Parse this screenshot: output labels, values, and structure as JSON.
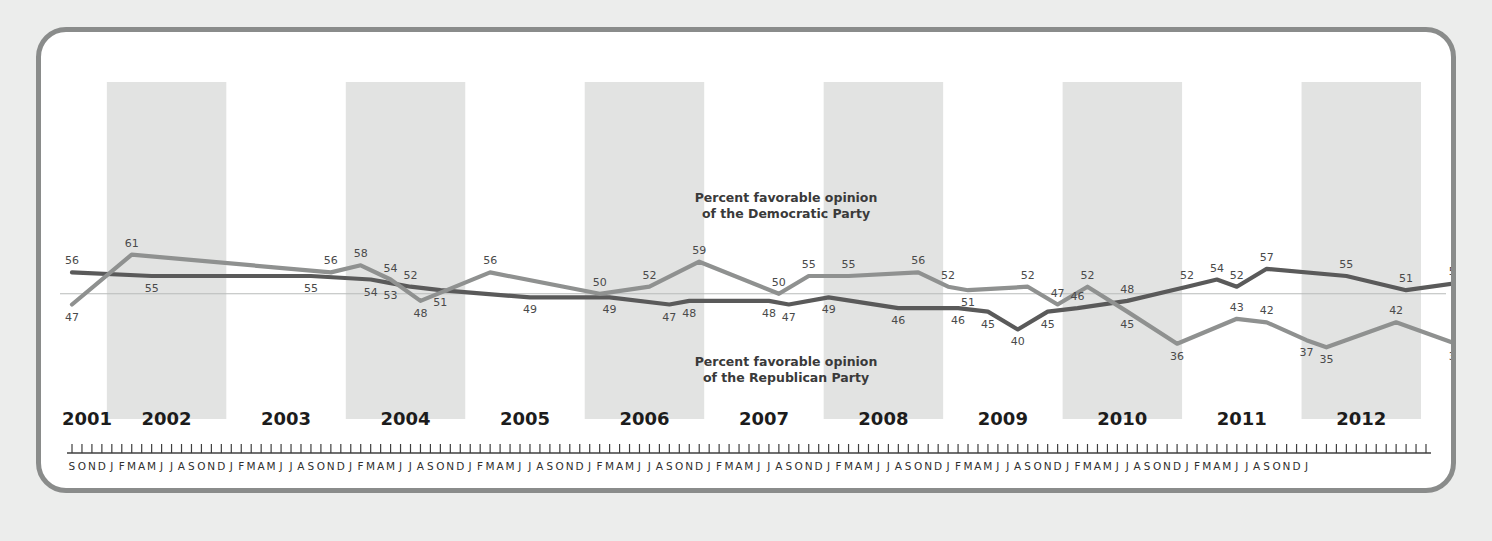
{
  "chart_data": {
    "type": "line",
    "title": "",
    "xlabel": "",
    "ylabel": "",
    "ylim": [
      30,
      63
    ],
    "grid": false,
    "legend_position": "inline-annotation",
    "annotations": [
      {
        "id": "dem",
        "text_line1": "Percent favorable opinion",
        "text_line2": "of the Democratic Party"
      },
      {
        "id": "rep",
        "text_line1": "Percent favorable opinion",
        "text_line2": "of the Republican Party"
      }
    ],
    "year_bands": [
      "2002",
      "2004",
      "2006",
      "2008",
      "2010",
      "2012"
    ],
    "years": [
      "2001",
      "2002",
      "2003",
      "2004",
      "2005",
      "2006",
      "2007",
      "2008",
      "2009",
      "2010",
      "2011",
      "2012"
    ],
    "month_ticks": "S O N D J F M A M J J A S O N D J F M A M J J A S O N D J F M A M J J A S O N D J F M A M J J A S O N D J F M A M J J A S O N D J F M A M J J A S O N D J F M A M J J A S O N D J F M A M J J A S O N D J F M A M J J A S O N D J F M A M J J A S O N D J",
    "series": [
      {
        "name": "Percent favorable opinion of the Democratic Party",
        "color": "#5a5a5a",
        "points": [
          {
            "t": 0,
            "label": "56",
            "value": 56,
            "lpos": "above"
          },
          {
            "t": 8,
            "label": "55",
            "value": 55,
            "lpos": "below"
          },
          {
            "t": 24,
            "label": "55",
            "value": 55,
            "lpos": "below"
          },
          {
            "t": 30,
            "label": "54",
            "value": 54,
            "lpos": "below"
          },
          {
            "t": 32,
            "label": "53",
            "value": 53,
            "lpos": "below"
          },
          {
            "t": 34,
            "label": "52",
            "value": 52,
            "lpos": "above"
          },
          {
            "t": 37,
            "label": "51",
            "value": 51,
            "lpos": "below"
          },
          {
            "t": 46,
            "label": "49",
            "value": 49,
            "lpos": "below"
          },
          {
            "t": 54,
            "label": "49",
            "value": 49,
            "lpos": "below"
          },
          {
            "t": 60,
            "label": "47",
            "value": 47,
            "lpos": "below"
          },
          {
            "t": 62,
            "label": "48",
            "value": 48,
            "lpos": "below"
          },
          {
            "t": 70,
            "label": "48",
            "value": 48,
            "lpos": "below"
          },
          {
            "t": 72,
            "label": "47",
            "value": 47,
            "lpos": "below"
          },
          {
            "t": 76,
            "label": "49",
            "value": 49,
            "lpos": "below"
          },
          {
            "t": 83,
            "label": "46",
            "value": 46,
            "lpos": "below"
          },
          {
            "t": 89,
            "label": "46",
            "value": 46,
            "lpos": "below"
          },
          {
            "t": 92,
            "label": "45",
            "value": 45,
            "lpos": "below"
          },
          {
            "t": 95,
            "label": "40",
            "value": 40,
            "lpos": "below"
          },
          {
            "t": 98,
            "label": "45",
            "value": 45,
            "lpos": "below"
          },
          {
            "t": 101,
            "label": "46",
            "value": 46,
            "lpos": "above"
          },
          {
            "t": 106,
            "label": "48",
            "value": 48,
            "lpos": "above"
          },
          {
            "t": 112,
            "label": "52",
            "value": 52,
            "lpos": "above"
          },
          {
            "t": 115,
            "label": "54",
            "value": 54,
            "lpos": "above"
          },
          {
            "t": 117,
            "label": "52",
            "value": 52,
            "lpos": "above"
          },
          {
            "t": 120,
            "label": "57",
            "value": 57,
            "lpos": "above"
          },
          {
            "t": 128,
            "label": "55",
            "value": 55,
            "lpos": "above"
          },
          {
            "t": 134,
            "label": "51",
            "value": 51,
            "lpos": "above"
          },
          {
            "t": 139,
            "label": "53",
            "value": 53,
            "lpos": "above"
          },
          {
            "t": 148,
            "label": "56",
            "value": 56,
            "lpos": "above"
          },
          {
            "t": 155,
            "label": "55",
            "value": 55,
            "lpos": "above"
          },
          {
            "t": 168,
            "label": "53",
            "value": 53,
            "lpos": "above"
          },
          {
            "t": 174,
            "label": "51",
            "value": 51,
            "lpos": "above"
          },
          {
            "t": 184,
            "label": "42",
            "value": 42,
            "lpos": "above"
          },
          {
            "t": 188,
            "label": "43",
            "value": 43,
            "lpos": "above"
          },
          {
            "t": 195,
            "label": "44",
            "value": 44,
            "lpos": "above"
          },
          {
            "t": 199,
            "label": "45",
            "value": 45,
            "lpos": "above"
          },
          {
            "t": 203,
            "label": "47",
            "value": 47,
            "lpos": "above"
          },
          {
            "t": 210,
            "label": "44",
            "value": 44,
            "lpos": "above"
          },
          {
            "t": 219,
            "label": "43",
            "value": 43,
            "lpos": "above"
          },
          {
            "t": 226,
            "label": "49",
            "value": 49,
            "lpos": "above"
          }
        ]
      },
      {
        "name": "Percent favorable opinion of the Republican Party",
        "color": "#8f9190",
        "points": [
          {
            "t": 0,
            "label": "47",
            "value": 47,
            "lpos": "below"
          },
          {
            "t": 6,
            "label": "61",
            "value": 61,
            "lpos": "above"
          },
          {
            "t": 26,
            "label": "56",
            "value": 56,
            "lpos": "above"
          },
          {
            "t": 29,
            "label": "58",
            "value": 58,
            "lpos": "above"
          },
          {
            "t": 32,
            "label": "54",
            "value": 54,
            "lpos": "above"
          },
          {
            "t": 35,
            "label": "48",
            "value": 48,
            "lpos": "below"
          },
          {
            "t": 42,
            "label": "56",
            "value": 56,
            "lpos": "above"
          },
          {
            "t": 53,
            "label": "50",
            "value": 50,
            "lpos": "above"
          },
          {
            "t": 58,
            "label": "52",
            "value": 52,
            "lpos": "above"
          },
          {
            "t": 63,
            "label": "59",
            "value": 59,
            "lpos": "above"
          },
          {
            "t": 71,
            "label": "50",
            "value": 50,
            "lpos": "above"
          },
          {
            "t": 74,
            "label": "55",
            "value": 55,
            "lpos": "above"
          },
          {
            "t": 78,
            "label": "55",
            "value": 55,
            "lpos": "above"
          },
          {
            "t": 85,
            "label": "56",
            "value": 56,
            "lpos": "above"
          },
          {
            "t": 88,
            "label": "52",
            "value": 52,
            "lpos": "above"
          },
          {
            "t": 90,
            "label": "51",
            "value": 51,
            "lpos": "below"
          },
          {
            "t": 96,
            "label": "52",
            "value": 52,
            "lpos": "above"
          },
          {
            "t": 99,
            "label": "47",
            "value": 47,
            "lpos": "above"
          },
          {
            "t": 102,
            "label": "52",
            "value": 52,
            "lpos": "above"
          },
          {
            "t": 106,
            "label": "45",
            "value": 45,
            "lpos": "below"
          },
          {
            "t": 111,
            "label": "36",
            "value": 36,
            "lpos": "below"
          },
          {
            "t": 117,
            "label": "43",
            "value": 43,
            "lpos": "above"
          },
          {
            "t": 120,
            "label": "42",
            "value": 42,
            "lpos": "above"
          },
          {
            "t": 124,
            "label": "37",
            "value": 37,
            "lpos": "below"
          },
          {
            "t": 126,
            "label": "35",
            "value": 35,
            "lpos": "below"
          },
          {
            "t": 133,
            "label": "42",
            "value": 42,
            "lpos": "above"
          },
          {
            "t": 139,
            "label": "36",
            "value": 36,
            "lpos": "below"
          },
          {
            "t": 143,
            "label": "38",
            "value": 38,
            "lpos": "below"
          },
          {
            "t": 150,
            "label": "39",
            "value": 39,
            "lpos": "below"
          },
          {
            "t": 157,
            "label": "39",
            "value": 39,
            "lpos": "below"
          },
          {
            "t": 170,
            "label": "34",
            "value": 34,
            "lpos": "below"
          },
          {
            "t": 178,
            "label": "40",
            "value": 40,
            "lpos": "below"
          },
          {
            "t": 184,
            "label": "41",
            "value": 41,
            "lpos": "below"
          },
          {
            "t": 188,
            "label": "36",
            "value": 36,
            "lpos": "below"
          },
          {
            "t": 195,
            "label": "44",
            "value": 44,
            "lpos": "below"
          },
          {
            "t": 199,
            "label": "43",
            "value": 43,
            "lpos": "below"
          },
          {
            "t": 205,
            "label": "46",
            "value": 46,
            "lpos": "below"
          },
          {
            "t": 211,
            "label": "43",
            "value": 43,
            "lpos": "below"
          },
          {
            "t": 219,
            "label": "42",
            "value": 42,
            "lpos": "below"
          },
          {
            "t": 226,
            "label": "43",
            "value": 43,
            "lpos": "below"
          }
        ]
      }
    ]
  }
}
